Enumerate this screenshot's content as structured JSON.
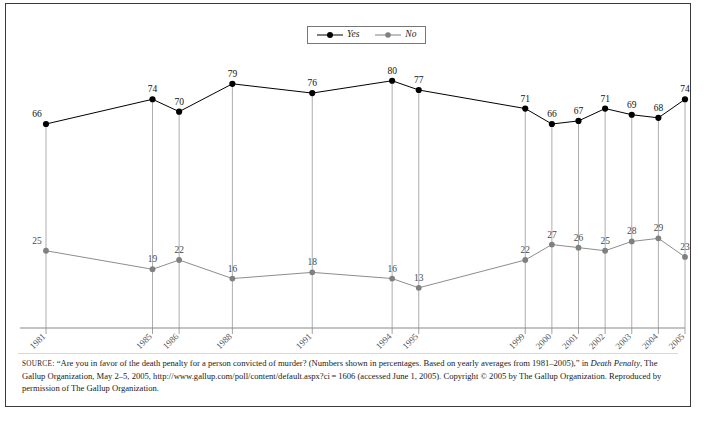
{
  "chart_data": {
    "type": "line",
    "title": "",
    "subtitle": "",
    "xlabel": "",
    "ylabel": "",
    "grid": false,
    "legend_position": "top-center",
    "ylim": [
      0,
      100
    ],
    "categories": [
      "1981",
      "1985",
      "1986",
      "1988",
      "1991",
      "1994",
      "1995",
      "1999",
      "2000",
      "2001",
      "2002",
      "2003",
      "2004",
      "2005"
    ],
    "x": [
      1981,
      1985,
      1986,
      1988,
      1991,
      1994,
      1995,
      1999,
      2000,
      2001,
      2002,
      2003,
      2004,
      2005
    ],
    "series": [
      {
        "name": "Yes",
        "color": "#000000",
        "values": [
          66,
          74,
          70,
          79,
          76,
          80,
          77,
          71,
          66,
          67,
          71,
          69,
          68,
          74
        ]
      },
      {
        "name": "No",
        "color": "#808080",
        "values": [
          25,
          19,
          22,
          16,
          18,
          16,
          13,
          22,
          27,
          26,
          25,
          28,
          29,
          23
        ]
      }
    ],
    "annotations": "Numbers shown in percentages."
  },
  "legend": {
    "items": [
      {
        "label": "Yes",
        "color": "#000000"
      },
      {
        "label": "No",
        "color": "#808080"
      }
    ]
  },
  "source_note": {
    "source_caps": "SOURCE",
    "part1": ": “Are you in favor of the death penalty for a person convicted of murder? (Numbers shown in percentages. Based on yearly averages from 1981–2005),” in ",
    "italic1": "Death Penalty",
    "part2": ", The Gallup Organization, May 2–5, 2005, http://www.gallup.com/poll/content/default.aspx?ci = 1606 (accessed June 1, 2005). Copyright © 2005 by The Gallup Organization. Reproduced by permission of The Gallup Organization."
  }
}
